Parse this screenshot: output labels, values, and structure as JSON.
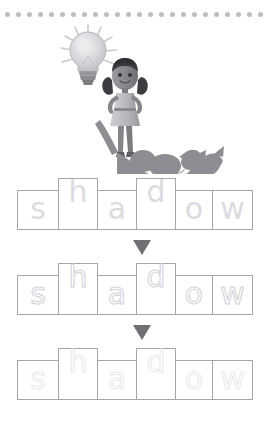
{
  "page": {
    "background_color": "#ffffff"
  },
  "header_rule": {
    "name": "dotted-rule",
    "dot_count": 24,
    "dot_color": "#bdbdc2",
    "dot_diameter_px": 5
  },
  "illustration": {
    "name": "girl-with-lightbulb-and-dog-shadow",
    "alt": "A girl with pigtails stands with hands on hips beside a glowing lightbulb; her shadow on the ground is shaped like a dog.",
    "elements": [
      {
        "name": "lightbulb-icon",
        "label": "light bulb"
      },
      {
        "name": "light-rays",
        "label": "rays"
      },
      {
        "name": "girl-character",
        "label": "girl"
      },
      {
        "name": "dog-shadow",
        "label": "dog shadow"
      }
    ],
    "colors": {
      "bulb_glass": "#d9d9dd",
      "bulb_base": "#8e8e93",
      "skin": "#8c8c90",
      "hair": "#3a3a3e",
      "dress": "#b9b9bd",
      "shadow": "#8d8d92"
    }
  },
  "word": {
    "text": "shadow",
    "letters": [
      "s",
      "h",
      "a",
      "d",
      "o",
      "w"
    ],
    "letter_heights": [
      "short",
      "tall",
      "short",
      "tall",
      "short",
      "short"
    ]
  },
  "rows": [
    {
      "name": "word-shape-row-1",
      "style": "filled",
      "letters": [
        "s",
        "h",
        "a",
        "d",
        "o",
        "w"
      ],
      "letter_color": "#dcdce0"
    },
    {
      "name": "word-shape-row-2",
      "style": "dashed-outline",
      "letters": [
        "s",
        "h",
        "a",
        "d",
        "o",
        "w"
      ],
      "letter_color": "#d2d2d7"
    },
    {
      "name": "word-shape-row-3",
      "style": "faint-dotted-outline",
      "letters": [
        "s",
        "h",
        "a",
        "d",
        "o",
        "w"
      ],
      "letter_color": "#e8e8ec"
    }
  ],
  "arrows": [
    {
      "name": "down-arrow-1",
      "glyph": "▼",
      "color": "#6f6f74"
    },
    {
      "name": "down-arrow-2",
      "glyph": "▼",
      "color": "#6f6f74"
    }
  ],
  "box_geometry": {
    "box_border_color": "#a5a5aa",
    "widths_px": [
      42,
      40,
      40,
      40,
      38,
      41
    ],
    "short_height_px": 40,
    "tall_height_px": 52
  }
}
